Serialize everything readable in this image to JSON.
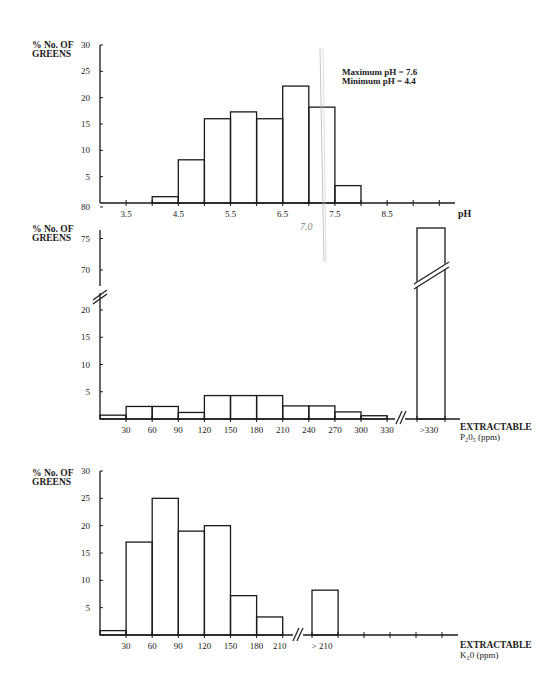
{
  "chart_data": [
    {
      "type": "bar",
      "id": "ph",
      "title": "",
      "ylabel": "% No. OF GREENS",
      "ylabel_lines": [
        "% No. OF",
        "GREENS"
      ],
      "xlabel": "pH",
      "ylim": [
        0,
        30
      ],
      "yticks": [
        5,
        10,
        15,
        20,
        25,
        30
      ],
      "xtick_labels": [
        "3.5",
        "4.5",
        "5.5",
        "6.5",
        "7.5",
        "8.5"
      ],
      "bins": [
        "4.0-4.5",
        "4.5-5.0",
        "5.0-5.5",
        "5.5-6.0",
        "6.0-6.5",
        "6.5-7.0",
        "7.0-7.5",
        "7.5-8.0"
      ],
      "values": [
        1.2,
        8.2,
        16.0,
        17.3,
        16.0,
        22.2,
        18.2,
        3.3
      ],
      "annotations": [
        "Maximum pH = 7.6",
        "Minimum pH = 4.4"
      ],
      "handwritten_note": "7.0",
      "grid": false,
      "legend": null
    },
    {
      "type": "bar",
      "id": "p2o5",
      "ylabel": "% No. OF GREENS",
      "ylabel_lines": [
        "% No. OF",
        "GREENS"
      ],
      "xlabel": "EXTRACTABLE P₂0₅ (ppm)",
      "xlabel_lines": [
        "EXTRACTABLE",
        "P₂0₅ (ppm)"
      ],
      "ylim": [
        0,
        80
      ],
      "y_axis_break": "between 20 and 70",
      "yticks": [
        5,
        10,
        15,
        20,
        70,
        75,
        80
      ],
      "xtick_labels": [
        "30",
        "60",
        "90",
        "120",
        "150",
        "180",
        "210",
        "240",
        "270",
        "300",
        "330",
        ">330"
      ],
      "bins": [
        "0-30",
        "30-60",
        "60-90",
        "90-120",
        "120-150",
        "150-180",
        "180-210",
        "210-240",
        "240-270",
        "270-300",
        "300-330",
        ">330"
      ],
      "values": [
        0.7,
        2.3,
        2.3,
        1.2,
        4.3,
        4.3,
        4.3,
        2.4,
        2.4,
        1.3,
        0.6,
        80
      ],
      "grid": false,
      "legend": null
    },
    {
      "type": "bar",
      "id": "k2o",
      "ylabel": "% No. OF GREENS",
      "ylabel_lines": [
        "% No. OF",
        "GREENS"
      ],
      "xlabel": "EXTRACTABLE K₂0 (ppm)",
      "xlabel_lines": [
        "EXTRACTABLE",
        "K₂0 (ppm)"
      ],
      "ylim": [
        0,
        30
      ],
      "yticks": [
        5,
        10,
        15,
        20,
        25,
        30
      ],
      "xtick_labels": [
        "30",
        "60",
        "90",
        "120",
        "150",
        "180",
        "210",
        "> 210"
      ],
      "bins": [
        "0-30",
        "30-60",
        "60-90",
        "90-120",
        "120-150",
        "150-180",
        "180-210",
        ">210"
      ],
      "values": [
        0.8,
        17.0,
        25.0,
        19.0,
        20.0,
        7.2,
        3.3,
        8.2
      ],
      "grid": false,
      "legend": null
    }
  ],
  "colors": {
    "ink": "#1a1a1a",
    "pencil": "#b8b8b8",
    "paper": "#ffffff"
  }
}
